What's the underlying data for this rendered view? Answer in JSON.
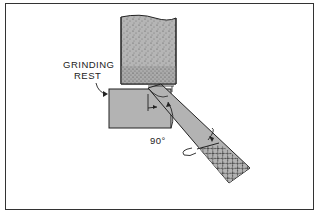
{
  "diagram": {
    "labels": {
      "rest_line1": "GRINDING",
      "rest_line2": "REST",
      "angle": "90°"
    },
    "components": [
      "grinding-wheel",
      "grinding-rest",
      "drill-bit"
    ],
    "colors": {
      "fill": "#b3b3b3",
      "stroke": "#222222",
      "frame": "#333333"
    }
  }
}
